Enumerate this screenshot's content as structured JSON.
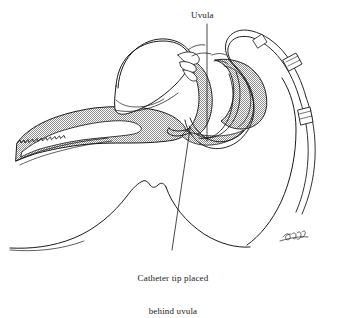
{
  "figure": {
    "domain": "medical-line-illustration",
    "background_color": "#ffffff",
    "ink_color": "#1a1a1a",
    "shading_color": "#9a9a9a",
    "width": 338,
    "height": 290
  },
  "annotations": {
    "uvula": {
      "label": "Uvula",
      "leader": "vertical line from label down to uvula"
    },
    "catheter": {
      "line1": "Catheter tip placed",
      "line2": "behind uvula",
      "leader": "diagonal line from catheter tip down-left to caption"
    }
  },
  "structures": [
    {
      "name": "head-profile",
      "shaded": false
    },
    {
      "name": "hard-palate",
      "shaded": false
    },
    {
      "name": "nasal-turbinates",
      "shaded": false
    },
    {
      "name": "tongue",
      "shaded": true
    },
    {
      "name": "soft-palate-uvula",
      "shaded": true
    },
    {
      "name": "pharyngeal-wall",
      "shaded": true
    },
    {
      "name": "nasal-catheter-tube",
      "shaded": false
    },
    {
      "name": "catheter-tape-marker",
      "shaded": false
    },
    {
      "name": "artist-signature",
      "shaded": false
    }
  ]
}
